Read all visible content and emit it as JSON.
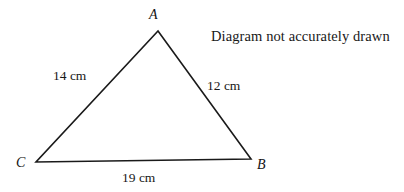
{
  "figure": {
    "name": "triangle-abc",
    "note": "Diagram not accurately drawn",
    "background_color": "#ffffff",
    "stroke_color": "#1a1a1a",
    "stroke_width": 1.6,
    "vertices": [
      {
        "id": "A",
        "label": "A",
        "x": 158,
        "y": 31
      },
      {
        "id": "B",
        "label": "B",
        "x": 251,
        "y": 159
      },
      {
        "id": "C",
        "label": "C",
        "x": 36,
        "y": 162
      }
    ],
    "sides": [
      {
        "id": "CA",
        "from": "C",
        "to": "A",
        "label": "14 cm",
        "value": 14,
        "unit": "cm"
      },
      {
        "id": "AB",
        "from": "A",
        "to": "B",
        "label": "12 cm",
        "value": 12,
        "unit": "cm"
      },
      {
        "id": "CB",
        "from": "C",
        "to": "B",
        "label": "19 cm",
        "value": 19,
        "unit": "cm"
      }
    ]
  },
  "chart_data": {
    "type": "diagram",
    "title": "",
    "annotations": [
      "Diagram not accurately drawn"
    ],
    "shape": "triangle",
    "categories": [
      "CA",
      "AB",
      "CB"
    ],
    "values": [
      14,
      12,
      19
    ],
    "unit": "cm",
    "vertex_labels": [
      "A",
      "B",
      "C"
    ]
  }
}
